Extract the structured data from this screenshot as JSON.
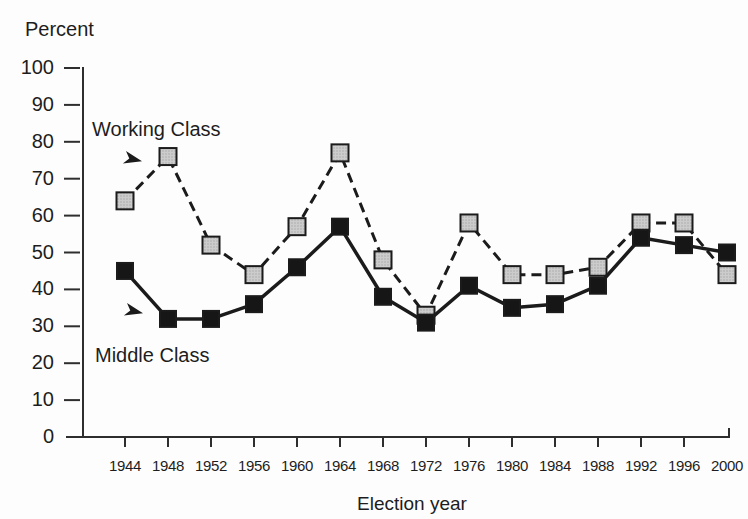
{
  "chart_data": {
    "type": "line",
    "title": "",
    "ylabel": "Percent",
    "xlabel": "Election year",
    "ylim": [
      0,
      100
    ],
    "y_ticks": [
      0,
      10,
      20,
      30,
      40,
      50,
      60,
      70,
      80,
      90,
      100
    ],
    "categories": [
      "1944",
      "1948",
      "1952",
      "1956",
      "1960",
      "1964",
      "1968",
      "1972",
      "1976",
      "1980",
      "1984",
      "1988",
      "1992",
      "1996",
      "2000"
    ],
    "series": [
      {
        "name": "Working Class",
        "line_style": "dashed",
        "marker": "square",
        "marker_fill": "#c9c9c9",
        "values": [
          64,
          76,
          52,
          44,
          57,
          77,
          48,
          33,
          58,
          44,
          44,
          46,
          58,
          58,
          44
        ]
      },
      {
        "name": "Middle Class",
        "line_style": "solid",
        "marker": "square",
        "marker_fill": "#161616",
        "values": [
          45,
          32,
          32,
          36,
          46,
          57,
          38,
          31,
          41,
          35,
          36,
          41,
          54,
          52,
          50
        ]
      }
    ],
    "grid": false,
    "legend": "direct-labels-with-arrows",
    "line_color": "#1b1b1b",
    "axis_color": "#2e2e2e",
    "background_color": "#fdfdfd"
  }
}
